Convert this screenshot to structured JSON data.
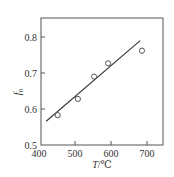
{
  "chart_data": {
    "type": "scatter",
    "title": "",
    "xlabel": "T/℃",
    "xlabel_italic_part": "T",
    "xlabel_unit": "/℃",
    "ylabel": "f0",
    "ylabel_base": "f",
    "ylabel_sub": "0",
    "xlim": [
      400,
      750
    ],
    "ylim": [
      0.5,
      0.845
    ],
    "x_ticks": [
      400,
      500,
      600,
      700
    ],
    "x_tick_labels": [
      "400",
      "500",
      "600",
      "700"
    ],
    "y_ticks": [
      0.5,
      0.6,
      0.7,
      0.8
    ],
    "y_tick_labels": [
      "0.5",
      "0.6",
      "0.7",
      "0.8"
    ],
    "grid": false,
    "legend": null,
    "series": [
      {
        "name": "measured",
        "marker": "open-circle",
        "x": [
          452,
          508,
          553,
          592,
          686
        ],
        "y": [
          0.583,
          0.628,
          0.69,
          0.727,
          0.762
        ]
      },
      {
        "name": "linear fit",
        "type": "line",
        "x": [
          420,
          681
        ],
        "y": [
          0.566,
          0.79
        ]
      }
    ],
    "colors": {
      "axis": "#555555",
      "line": "#333333",
      "marker": "#444444"
    }
  }
}
